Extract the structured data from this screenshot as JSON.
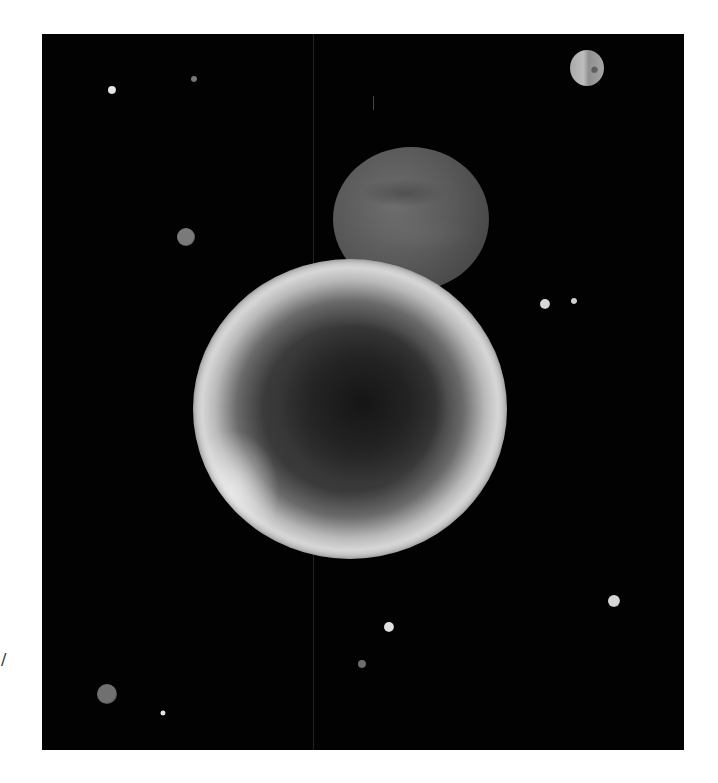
{
  "scene": {
    "description": "Grayscale illustration of planets and moons against a black starfield",
    "background_color": "#020202",
    "page_color": "#ffffff",
    "panel": {
      "x": 42,
      "y": 34,
      "width": 642,
      "height": 716
    },
    "edge_mark": "/",
    "planets": [
      {
        "name": "back-planet",
        "cx": 411,
        "cy": 219,
        "rx": 78,
        "ry": 72,
        "tone": "dark gray"
      },
      {
        "name": "front-planet",
        "cx": 350,
        "cy": 409,
        "rx": 157,
        "ry": 150,
        "tone": "dark core with bright gray rim"
      },
      {
        "name": "small-moon",
        "cx": 587,
        "cy": 68,
        "rx": 17,
        "ry": 18,
        "tone": "light gray"
      }
    ],
    "stars": [
      {
        "cx": 112,
        "cy": 90,
        "r": 4,
        "color": "#e6e6e6"
      },
      {
        "cx": 194,
        "cy": 79,
        "r": 3,
        "color": "#777777"
      },
      {
        "cx": 186,
        "cy": 237,
        "r": 9,
        "color": "#7a7a7a"
      },
      {
        "cx": 545,
        "cy": 304,
        "r": 5,
        "color": "#d8d8d8"
      },
      {
        "cx": 574,
        "cy": 301,
        "r": 3,
        "color": "#cfcfcf"
      },
      {
        "cx": 389,
        "cy": 627,
        "r": 5,
        "color": "#e0e0e0"
      },
      {
        "cx": 362,
        "cy": 664,
        "r": 4,
        "color": "#6e6e6e"
      },
      {
        "cx": 614,
        "cy": 601,
        "r": 6,
        "color": "#d6d6d6"
      },
      {
        "cx": 107,
        "cy": 694,
        "r": 10,
        "color": "#707070"
      },
      {
        "cx": 163,
        "cy": 713,
        "r": 2.5,
        "color": "#e6e6e6"
      }
    ]
  }
}
